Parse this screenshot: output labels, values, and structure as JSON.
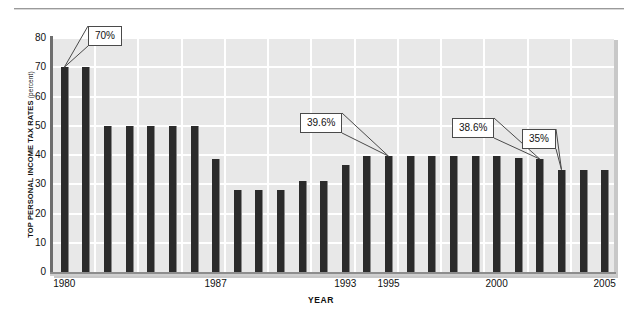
{
  "chart_data": {
    "type": "bar",
    "title": "",
    "xlabel": "YEAR",
    "ylabel": "TOP PERSONAL INCOME TAX RATES",
    "ylabel_unit": "(percent)",
    "ylim": [
      0,
      80
    ],
    "ytick_values": [
      0,
      10,
      20,
      30,
      40,
      50,
      60,
      70,
      80
    ],
    "ytick_labels": [
      "0",
      "10",
      "20",
      "30",
      "40",
      "50",
      "60",
      "70",
      "80"
    ],
    "grid": true,
    "legend": "none",
    "bar_color": "#2b2b2b",
    "plot_background": "#e8e8e8",
    "xtick_labels": [
      "1980",
      "1987",
      "1993",
      "1995",
      "2000",
      "2005"
    ],
    "categories": [
      "1980",
      "1981",
      "1982",
      "1983",
      "1984",
      "1985",
      "1986",
      "1987",
      "1988",
      "1989",
      "1990",
      "1991",
      "1992",
      "1993",
      "1994",
      "1995",
      "1996",
      "1997",
      "1998",
      "1999",
      "2000",
      "2001",
      "2002",
      "2003",
      "2004",
      "2005"
    ],
    "values": [
      70,
      70,
      50,
      50,
      50,
      50,
      50,
      38.5,
      28,
      28,
      28,
      31,
      31,
      36.5,
      39.6,
      39.6,
      39.6,
      39.6,
      39.6,
      39.6,
      39.6,
      39.1,
      38.6,
      35,
      35,
      35
    ],
    "annotations": [
      {
        "label": "70%",
        "category": "1980",
        "value": 70
      },
      {
        "label": "39.6%",
        "category": "1995",
        "value": 39.6
      },
      {
        "label": "38.6%",
        "category": "2002",
        "value": 38.6
      },
      {
        "label": "35%",
        "category": "2003",
        "value": 35
      }
    ]
  }
}
